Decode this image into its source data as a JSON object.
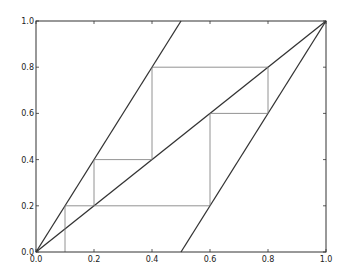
{
  "chart_data": {
    "type": "line",
    "title": "",
    "xlabel": "",
    "ylabel": "",
    "xlim": [
      0.0,
      1.0
    ],
    "ylim": [
      0.0,
      1.0
    ],
    "grid": false,
    "legend": null,
    "x_ticks": [
      0.0,
      0.2,
      0.4,
      0.6,
      0.8,
      1.0
    ],
    "y_ticks": [
      0.0,
      0.2,
      0.4,
      0.6,
      0.8,
      1.0
    ],
    "x_tick_labels": [
      "0.0",
      "0.2",
      "0.4",
      "0.6",
      "0.8",
      "1.0"
    ],
    "y_tick_labels": [
      "0.0",
      "0.2",
      "0.4",
      "0.6",
      "0.8",
      "1.0"
    ],
    "series": [
      {
        "name": "doubling map left branch (y = 2x)",
        "x": [
          0.0,
          0.5
        ],
        "y": [
          0.0,
          1.0
        ],
        "color": "#333333",
        "width": 1.3
      },
      {
        "name": "doubling map right branch (y = 2x - 1)",
        "x": [
          0.5,
          1.0
        ],
        "y": [
          0.0,
          1.0
        ],
        "color": "#333333",
        "width": 1.3
      },
      {
        "name": "diagonal (y = x)",
        "x": [
          0.0,
          1.0
        ],
        "y": [
          0.0,
          1.0
        ],
        "color": "#333333",
        "width": 1.3
      },
      {
        "name": "cobweb path",
        "x": [
          0.1,
          0.1,
          0.2,
          0.2,
          0.4,
          0.4,
          0.8,
          0.8,
          0.6,
          0.6,
          0.2
        ],
        "y": [
          0.0,
          0.2,
          0.2,
          0.4,
          0.4,
          0.8,
          0.8,
          0.6,
          0.6,
          0.2,
          0.2
        ],
        "color": "#777777",
        "width": 0.8
      }
    ]
  }
}
